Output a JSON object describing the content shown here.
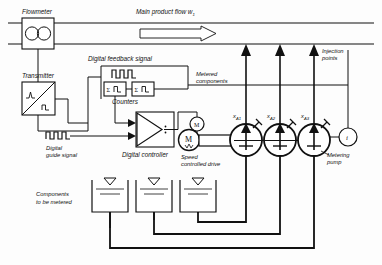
{
  "diagram": {
    "labels": {
      "flowmeter": "Flowmeter",
      "main_flow": "Main product flow w",
      "main_flow_sub": "1",
      "transmitter": "Transmitter",
      "digital_feedback": "Digital feedback signal",
      "counters": "Counters",
      "digital_guide_1": "Digital",
      "digital_guide_2": "guide signal",
      "digital_controller": "Digital controller",
      "metered_1": "Metered",
      "metered_2": "components",
      "injection_1": "Injection",
      "injection_2": "points",
      "speed_drive_1": "Speed",
      "speed_drive_2": "controlled drive",
      "metering_pump_1": "Metering",
      "metering_pump_2": "pump",
      "components_1": "Components",
      "components_2": "to be metered"
    },
    "pump_labels": [
      {
        "base": "x",
        "sub": "A1"
      },
      {
        "base": "x",
        "sub": "A2"
      },
      {
        "base": "x",
        "sub": "A3"
      }
    ],
    "symbols": {
      "counter_sigma": "Σ",
      "motor_large": "M",
      "motor_small": "M",
      "indicator": "i"
    },
    "colors": {
      "line": "#111111",
      "background": "#ffffff",
      "fill": "#ffffff"
    }
  }
}
